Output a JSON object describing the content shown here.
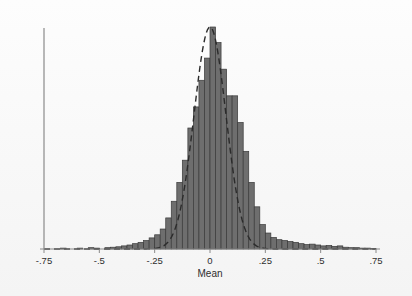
{
  "chart_data": {
    "type": "bar",
    "title": "",
    "subtitle": "",
    "xlabel": "Mean",
    "ylabel": "",
    "xlim": [
      -0.75,
      0.75
    ],
    "ylim": [
      0,
      1.0
    ],
    "grid": false,
    "legend": null,
    "xticks": [
      -0.75,
      -0.5,
      -0.25,
      0,
      0.25,
      0.5,
      0.75
    ],
    "xticklabels": [
      "-.75",
      "-.5",
      "-.25",
      "0",
      ".25",
      ".5",
      ".75"
    ],
    "yticks": [],
    "yticklabels": [],
    "bin_width": 0.025,
    "annotations": [
      {
        "name": "normal-density-overlay",
        "style": "dashed",
        "description": "Normal density curve fitted to the histogram"
      }
    ],
    "series": [
      {
        "name": "Histogram of Mean",
        "x": [
          -0.7375,
          -0.7125,
          -0.6875,
          -0.6625,
          -0.6375,
          -0.6125,
          -0.5875,
          -0.5625,
          -0.5375,
          -0.5125,
          -0.4875,
          -0.4625,
          -0.4375,
          -0.4125,
          -0.3875,
          -0.3625,
          -0.3375,
          -0.3125,
          -0.2875,
          -0.2625,
          -0.2375,
          -0.2125,
          -0.1875,
          -0.1625,
          -0.1375,
          -0.1125,
          -0.0875,
          -0.0625,
          -0.0375,
          -0.0125,
          0.0125,
          0.0375,
          0.0625,
          0.0875,
          0.1125,
          0.1375,
          0.1625,
          0.1875,
          0.2125,
          0.2375,
          0.2625,
          0.2875,
          0.3125,
          0.3375,
          0.3625,
          0.3875,
          0.4125,
          0.4375,
          0.4625,
          0.4875,
          0.5125,
          0.5375,
          0.5625,
          0.5875,
          0.6125,
          0.6375,
          0.6625,
          0.6875,
          0.7125,
          0.7375
        ],
        "values": [
          0.0,
          0.0,
          0.0,
          0.004,
          0.0,
          0.0,
          0.004,
          0.0,
          0.006,
          0.004,
          0.0,
          0.006,
          0.008,
          0.01,
          0.014,
          0.018,
          0.024,
          0.03,
          0.038,
          0.05,
          0.064,
          0.09,
          0.14,
          0.215,
          0.3,
          0.4,
          0.545,
          0.64,
          0.76,
          0.86,
          1.0,
          0.93,
          0.81,
          0.69,
          0.69,
          0.57,
          0.44,
          0.3,
          0.19,
          0.11,
          0.072,
          0.052,
          0.042,
          0.038,
          0.034,
          0.03,
          0.024,
          0.02,
          0.022,
          0.018,
          0.014,
          0.016,
          0.012,
          0.014,
          0.008,
          0.006,
          0.006,
          0.004,
          0.004,
          0.002
        ]
      }
    ],
    "fit_curve": {
      "name": "Normal density",
      "mean": 0.0,
      "sd": 0.072,
      "peak_value": 1.0
    },
    "colors": {
      "bar_fill": "#6e6e6e",
      "bar_stroke": "#3a3a3a",
      "curve": "#2b2b2b",
      "axis": "#8a8a8a",
      "text": "#2e2e2e",
      "background": "#fbfbfb"
    }
  }
}
